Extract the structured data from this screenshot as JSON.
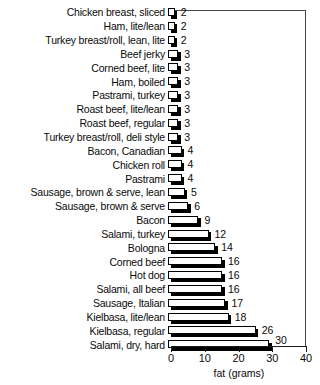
{
  "chart_data": {
    "type": "bar",
    "orientation": "horizontal",
    "title": "",
    "xlabel": "fat (grams)",
    "ylabel": "",
    "xlim": [
      0,
      40
    ],
    "xticks": [
      0,
      10,
      20,
      30,
      40
    ],
    "xticklabels": [
      "0",
      "10",
      "20",
      "30",
      "40"
    ],
    "grid": false,
    "legend": null,
    "categories": [
      "Chicken breast, sliced",
      "Ham, lite/lean",
      "Turkey breast/roll, lean, lite",
      "Beef jerky",
      "Corned beef, lite",
      "Ham, boiled",
      "Pastrami, turkey",
      "Roast beef, lite/lean",
      "Roast beef, regular",
      "Turkey breast/roll, deli style",
      "Bacon, Canadian",
      "Chicken roll",
      "Pastrami",
      "Sausage, brown & serve, lean",
      "Sausage, brown & serve",
      "Bacon",
      "Salami, turkey",
      "Bologna",
      "Corned beef",
      "Hot dog",
      "Salami, all beef",
      "Sausage, Italian",
      "Kielbasa, lite/lean",
      "Kielbasa, regular",
      "Salami, dry, hard"
    ],
    "values": [
      2,
      2,
      2,
      3,
      3,
      3,
      3,
      3,
      3,
      3,
      4,
      4,
      4,
      5,
      6,
      9,
      12,
      14,
      16,
      16,
      16,
      17,
      18,
      26,
      30
    ],
    "value_labels": [
      "2",
      "2",
      "2",
      "3",
      "3",
      "3",
      "3",
      "3",
      "3",
      "3",
      "4",
      "4",
      "4",
      "5",
      "6",
      "9",
      "12",
      "14",
      "16",
      "16",
      "16",
      "17",
      "18",
      "26",
      "30"
    ]
  },
  "colors": {
    "bar_face": "#ffffff",
    "bar_outline": "#000000",
    "bar_shadow": "#000000",
    "axis": "#1a1a1a",
    "frame": "#444444",
    "text": "#0a0a0a",
    "background": "#ffffff"
  }
}
